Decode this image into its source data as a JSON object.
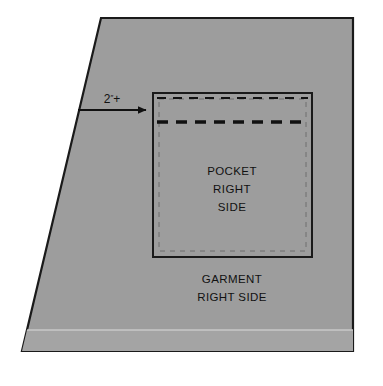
{
  "diagram": {
    "colors": {
      "background": "#ffffff",
      "garment_fill": "#9d9d9d",
      "garment_fill_shade": "#a4a4a4",
      "outline": "#1a1a1a",
      "stitch_line": "#111111",
      "faint_fold_line": "#c9c9c9",
      "text": "#111111"
    },
    "garment": {
      "name": "garment-piece",
      "shape": "trapezoid",
      "label_line_1": "GARMENT",
      "label_line_2": "RIGHT SIDE"
    },
    "pocket": {
      "name": "pocket-piece",
      "shape": "square",
      "label_line_1": "POCKET",
      "label_line_2": "RIGHT",
      "label_line_3": "SIDE",
      "stitch_line_upper": "dashed-thin",
      "stitch_line_lower": "dashed-thick",
      "seam_allowance": "dashed-inset"
    },
    "measurement": {
      "name": "placement-measurement",
      "value": "2",
      "unit_mark": "″",
      "modifier": "+",
      "full_text": "2″+",
      "pointer": "arrow-right"
    }
  }
}
